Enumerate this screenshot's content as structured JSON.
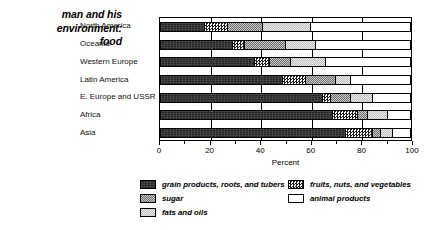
{
  "caption": {
    "line1": "man and his",
    "line2": "environment:",
    "line3": "food"
  },
  "chart_data": {
    "type": "bar",
    "orientation": "horizontal",
    "stacked": true,
    "stack_total": 100,
    "title": "",
    "xlabel": "Percent",
    "ylabel": "",
    "xlim": [
      0,
      100
    ],
    "grid": true,
    "legend_position": "bottom",
    "categories": [
      "North America",
      "Oceania",
      "Western Europe",
      "Latin America",
      "E. Europe and USSR",
      "Africa",
      "Asia"
    ],
    "series": [
      {
        "name": "grain products, roots, and tubers",
        "pattern": "dark-solid",
        "values": [
          18,
          29,
          38,
          49,
          65,
          69,
          74
        ]
      },
      {
        "name": "fruits, nuts, and vegetables",
        "pattern": "checkerboard",
        "values": [
          9,
          5,
          6,
          9,
          3,
          10,
          11
        ]
      },
      {
        "name": "sugar",
        "pattern": "medium-gray-stipple",
        "values": [
          14,
          16,
          8,
          12,
          8,
          4,
          3
        ]
      },
      {
        "name": "fats and oils",
        "pattern": "light-gray-stipple",
        "values": [
          19,
          12,
          14,
          6,
          9,
          8,
          5
        ]
      },
      {
        "name": "animal products",
        "pattern": "white",
        "values": [
          40,
          38,
          34,
          24,
          15,
          9,
          7
        ]
      }
    ],
    "xticks": [
      0,
      20,
      40,
      60,
      80,
      100
    ],
    "xtick_labels": [
      "0",
      "20",
      "40",
      "60",
      "80",
      "100"
    ],
    "xminor_ticks": [
      10,
      30,
      50,
      70,
      90
    ]
  },
  "legend": {
    "items": [
      {
        "label": "grain products, roots, and tubers",
        "swatch": "grain"
      },
      {
        "label": "sugar",
        "swatch": "sugar"
      },
      {
        "label": "fats and oils",
        "swatch": "fats"
      },
      {
        "label": "fruits, nuts, and vegetables",
        "swatch": "fruits"
      },
      {
        "label": "animal products",
        "swatch": "animal"
      }
    ]
  }
}
